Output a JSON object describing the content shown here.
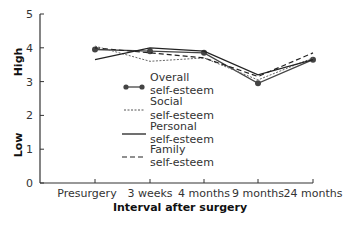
{
  "chart_data": {
    "type": "line",
    "title": "",
    "xlabel": "Interval after surgery",
    "ylabel_high": "High",
    "ylabel_low": "Low",
    "ylim": [
      0,
      5
    ],
    "yticks": [
      "0",
      "1",
      "2",
      "3",
      "4",
      "5"
    ],
    "grid": false,
    "legend_position": "inside-center",
    "categories": [
      "Presurgery",
      "3 weeks",
      "4 months",
      "9 months",
      "24 months"
    ],
    "series": [
      {
        "name": "Overall self-esteem",
        "legend_line1": "Overall",
        "legend_line2": "self-esteem",
        "style": "solid-markers",
        "values": [
          3.95,
          3.9,
          3.85,
          2.95,
          3.65
        ]
      },
      {
        "name": "Social self-esteem",
        "legend_line1": "Social",
        "legend_line2": "self-esteem",
        "style": "dotted",
        "values": [
          4.05,
          3.6,
          3.7,
          3.05,
          3.7
        ]
      },
      {
        "name": "Personal self-esteem",
        "legend_line1": "Personal",
        "legend_line2": "self-esteem",
        "style": "solid",
        "values": [
          3.65,
          4.0,
          3.9,
          3.2,
          3.65
        ]
      },
      {
        "name": "Family self-esteem",
        "legend_line1": "Family",
        "legend_line2": "self-esteem",
        "style": "dashed",
        "values": [
          4.0,
          3.85,
          3.7,
          3.15,
          3.85
        ]
      }
    ]
  }
}
